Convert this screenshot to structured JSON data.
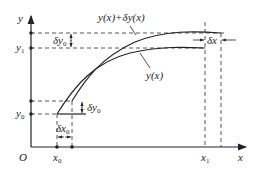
{
  "diagram": {
    "axes": {
      "x_label": "x",
      "y_label": "y",
      "origin_label": "O"
    },
    "x_ticks": {
      "x0": "x",
      "x0_sub": "0",
      "x1": "x",
      "x1_sub": "1"
    },
    "y_ticks": {
      "y0": "y",
      "y0_sub": "0",
      "y1": "y",
      "y1_sub": "1"
    },
    "curves": {
      "base_label": "y(x)",
      "perturbed_label": "y(x)+δy(x)"
    },
    "deltas": {
      "dy0_top": "δy",
      "dy0_top_sub": "0",
      "dy0_bottom": "δy",
      "dy0_bottom_sub": "0",
      "dx0": "δx",
      "dx0_sub": "0",
      "dx1": "δx"
    },
    "colors": {
      "line": "#222222",
      "background": "#ffffff"
    }
  }
}
